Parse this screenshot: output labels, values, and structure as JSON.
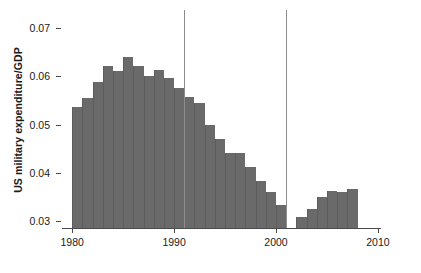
{
  "chart_data": {
    "type": "bar",
    "title": "",
    "xlabel": "",
    "ylabel": "US military expenditure/GDP",
    "xlim": [
      1979,
      2010.3
    ],
    "ylim": [
      0.0285,
      0.0715
    ],
    "grid": false,
    "legend": null,
    "bar_color": "#6a6a6a",
    "axis_color": "#4a4a4a",
    "vline_color": "#8d8d8d",
    "xticks": [
      1980,
      1990,
      2000,
      2010
    ],
    "xticklabels": [
      "1980",
      "1990",
      "2000",
      "2010"
    ],
    "yticks": [
      0.03,
      0.04,
      0.05,
      0.06,
      0.07
    ],
    "yticklabels": [
      "0.03",
      "0.04",
      "0.05",
      "0.06",
      "0.07"
    ],
    "annotations": [
      {
        "name": "vline-1991",
        "type": "vline",
        "x": 1991
      },
      {
        "name": "vline-2001",
        "type": "vline",
        "x": 2001
      }
    ],
    "categories": [
      1980,
      1981,
      1982,
      1983,
      1984,
      1985,
      1986,
      1987,
      1988,
      1989,
      1990,
      1991,
      1992,
      1993,
      1994,
      1995,
      1996,
      1997,
      1998,
      1999,
      2000,
      2002,
      2003,
      2004,
      2005,
      2006,
      2007
    ],
    "values": [
      0.0537,
      0.0556,
      0.0588,
      0.0621,
      0.0612,
      0.064,
      0.0622,
      0.06,
      0.0614,
      0.0597,
      0.0576,
      0.0558,
      0.0545,
      0.05,
      0.047,
      0.044,
      0.044,
      0.0412,
      0.0383,
      0.036,
      0.0332,
      0.0307,
      0.0325,
      0.035,
      0.0362,
      0.036,
      0.0366
    ],
    "missing_years": [
      2001
    ],
    "bar_edge_color": "#5c5c5c"
  }
}
